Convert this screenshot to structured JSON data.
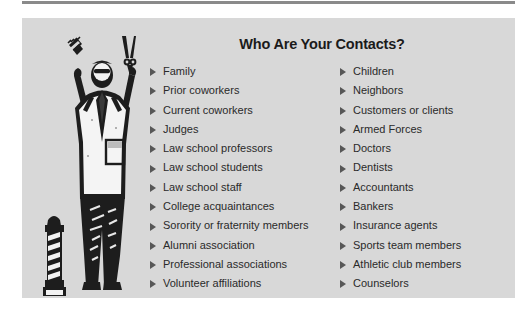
{
  "page": {
    "panel_background": "#d8d8d8",
    "rule_color": "#8a8a8a",
    "text_color": "#2a2a2a",
    "bullet_color": "#575757"
  },
  "illustration": {
    "name": "barber-illustration",
    "description": "Barber holding comb and scissors with barber pole",
    "parts": [
      "barber-figure",
      "comb",
      "scissors",
      "barber-pole"
    ]
  },
  "heading": {
    "title": "Who Are Your Contacts?"
  },
  "contacts": {
    "bullet_glyph": "triangle-right",
    "left_column": [
      "Family",
      "Prior coworkers",
      "Current coworkers",
      "Judges",
      "Law school professors",
      "Law school students",
      "Law school staff",
      "College acquaintances",
      "Sorority or fraternity members",
      "Alumni association",
      "Professional associations",
      "Volunteer affiliations"
    ],
    "right_column": [
      "Children",
      "Neighbors",
      "Customers or clients",
      "Armed Forces",
      "Doctors",
      "Dentists",
      "Accountants",
      "Bankers",
      "Insurance agents",
      "Sports team members",
      "Athletic club members",
      "Counselors"
    ]
  }
}
